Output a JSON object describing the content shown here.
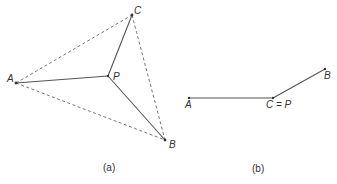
{
  "figure_a": {
    "caption": "(a)",
    "points": {
      "A": {
        "label": "A",
        "x": 16,
        "y": 83
      },
      "B": {
        "label": "B",
        "x": 165,
        "y": 140
      },
      "C": {
        "label": "C",
        "x": 132,
        "y": 15
      },
      "P": {
        "label": "P",
        "x": 108,
        "y": 76
      }
    },
    "solid_edges": [
      [
        "A",
        "P"
      ],
      [
        "B",
        "P"
      ],
      [
        "C",
        "P"
      ]
    ],
    "dashed_edges": [
      [
        "A",
        "C"
      ],
      [
        "A",
        "B"
      ],
      [
        "C",
        "B"
      ]
    ]
  },
  "figure_b": {
    "caption": "(b)",
    "points": {
      "A": {
        "label": "A",
        "x": 189,
        "y": 98
      },
      "CP": {
        "label": "C = P",
        "x": 273,
        "y": 98
      },
      "B": {
        "label": "B",
        "x": 325,
        "y": 69
      }
    },
    "solid_edges": [
      [
        "A",
        "CP"
      ],
      [
        "CP",
        "B"
      ]
    ]
  },
  "colors": {
    "line": "#555555",
    "text": "#333333",
    "background": "#ffffff"
  }
}
